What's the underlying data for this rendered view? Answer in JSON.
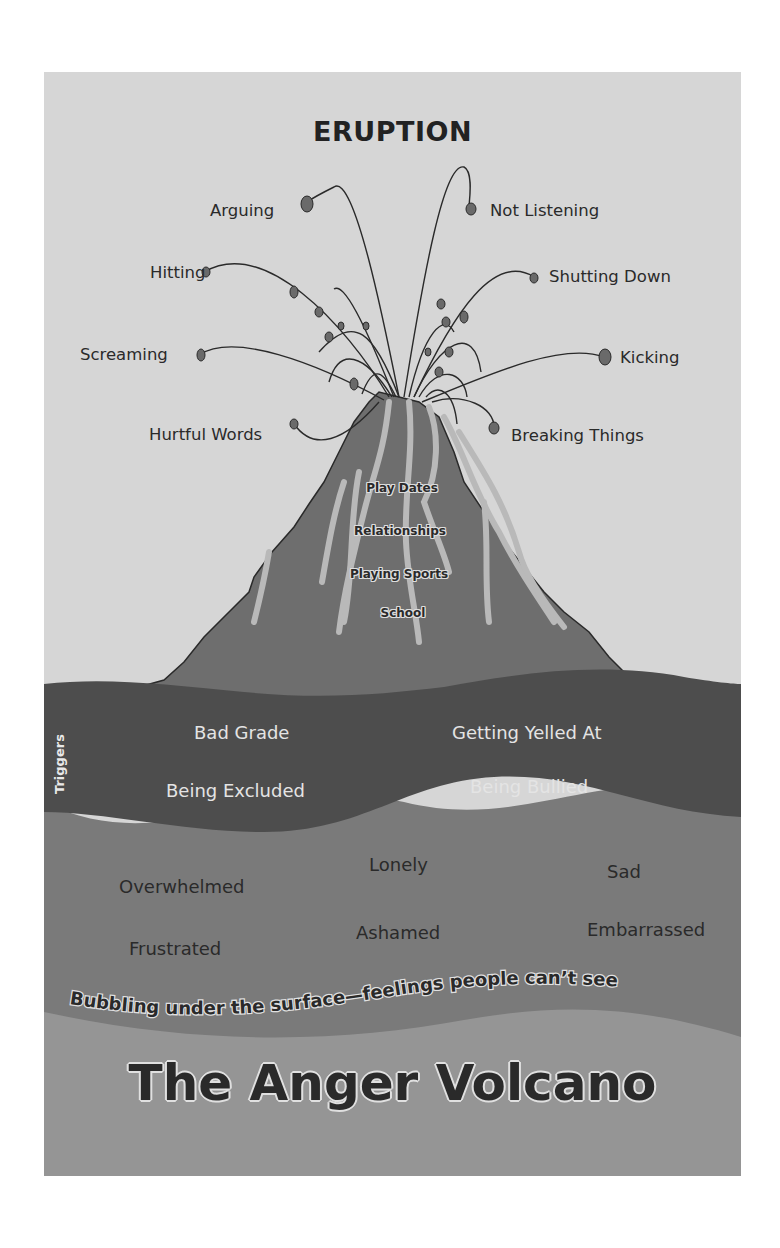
{
  "poster": {
    "heading": "ERUPTION",
    "title": "The Anger Volcano",
    "colors": {
      "background": "#d6d6d6",
      "volcano": "#6e6e6e",
      "lava_streaks": "#b9b9b9",
      "triggers_layer": "#4d4d4d",
      "feelings_layer": "#7a7a7a",
      "bottom_layer": "#959595",
      "text_dark": "#2a2a2a",
      "text_light": "#e4e4e4"
    }
  },
  "eruption": {
    "left": [
      "Arguing",
      "Hitting",
      "Screaming",
      "Hurtful Words"
    ],
    "right": [
      "Not Listening",
      "Shutting Down",
      "Kicking",
      "Breaking Things"
    ]
  },
  "volcano_cone": {
    "items": [
      "Play Dates",
      "Relationships",
      "Playing Sports",
      "School"
    ]
  },
  "triggers": {
    "label": "Triggers",
    "items": [
      "Bad Grade",
      "Getting Yelled At",
      "Being Excluded",
      "Being Bullied"
    ]
  },
  "feelings": {
    "items": [
      "Overwhelmed",
      "Lonely",
      "Sad",
      "Frustrated",
      "Ashamed",
      "Embarrassed"
    ],
    "caption": "Bubbling under the surface—feelings people can’t see"
  }
}
